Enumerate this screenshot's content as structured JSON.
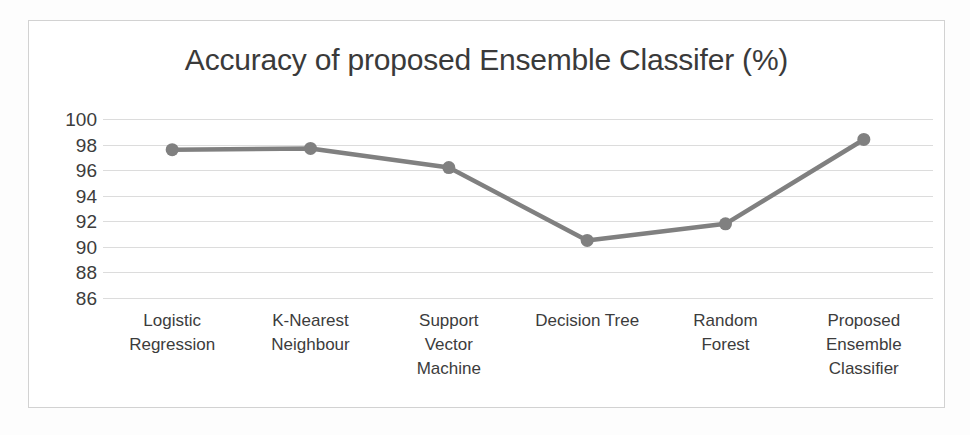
{
  "chart_data": {
    "type": "line",
    "title": "Accuracy of proposed Ensemble Classifer (%)",
    "xlabel": "",
    "ylabel": "",
    "ylim": [
      86,
      100
    ],
    "yticks": [
      100,
      98,
      96,
      94,
      92,
      90,
      88,
      86
    ],
    "grid": true,
    "legend": false,
    "legend_position": "none",
    "series_color": "#808080",
    "marker": "circle",
    "categories": [
      "Logistic Regression",
      "K-Nearest Neighbour",
      "Support Vector Machine",
      "Decision Tree",
      "Random Forest",
      "Proposed Ensemble Classifier"
    ],
    "category_lines": [
      [
        "Logistic",
        "Regression"
      ],
      [
        "K-Nearest",
        "Neighbour"
      ],
      [
        "Support",
        "Vector",
        "Machine"
      ],
      [
        "Decision Tree"
      ],
      [
        "Random",
        "Forest"
      ],
      [
        "Proposed",
        "Ensemble",
        "Classifier"
      ]
    ],
    "values": [
      97.6,
      97.7,
      96.2,
      90.5,
      91.8,
      98.4
    ]
  },
  "figure": {
    "border_color": "#d2d2d2",
    "background": "#ffffff",
    "gridline_color": "#dcdcdc",
    "text_color": "#3c3c3c"
  }
}
